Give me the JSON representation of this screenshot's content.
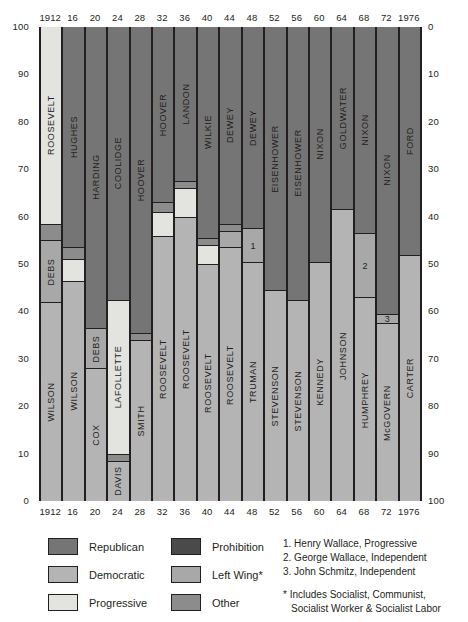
{
  "chart_data": {
    "type": "bar",
    "title": "",
    "subtitle": "",
    "xlabel": "",
    "ylabel": "",
    "ylim": [
      0,
      100
    ],
    "left_axis_ticks": [
      "100",
      "90",
      "80",
      "70",
      "60",
      "50",
      "40",
      "30",
      "20",
      "10",
      "0"
    ],
    "right_axis_ticks": [
      "0",
      "10",
      "20",
      "30",
      "40",
      "50",
      "60",
      "70",
      "80",
      "90",
      "100"
    ],
    "left_axis_direction": "descending",
    "right_axis_direction": "ascending",
    "grid": false,
    "legend_position": "bottom",
    "categories": [
      "1912",
      "16",
      "20",
      "24",
      "28",
      "32",
      "36",
      "40",
      "44",
      "48",
      "52",
      "56",
      "60",
      "64",
      "68",
      "72",
      "1976"
    ],
    "top_year_labels": [
      "1912",
      "16",
      "20",
      "24",
      "28",
      "32",
      "36",
      "40",
      "44",
      "48",
      "52",
      "56",
      "60",
      "64",
      "68",
      "72",
      "1976"
    ],
    "bottom_year_labels": [
      "1912",
      "16",
      "20",
      "24",
      "28",
      "32",
      "36",
      "40",
      "44",
      "48",
      "52",
      "56",
      "60",
      "64",
      "68",
      "72",
      "1976"
    ],
    "stack_order": "top-to-bottom",
    "columns": [
      {
        "year": "1912",
        "segments": [
          {
            "party": "Progressive",
            "label": "ROOSEVELT",
            "value": 41.5
          },
          {
            "party": "Other",
            "label": "",
            "value": 3.5
          },
          {
            "party": "Left Wing",
            "label": "DEBS",
            "value": 13.0
          },
          {
            "party": "Democratic",
            "label": "WILSON",
            "value": 42.0
          }
        ]
      },
      {
        "year": "16",
        "segments": [
          {
            "party": "Republican",
            "label": "HUGHES",
            "value": 46.5
          },
          {
            "party": "Other",
            "label": "",
            "value": 2.5
          },
          {
            "party": "Progressive",
            "label": "",
            "value": 4.5
          },
          {
            "party": "Democratic",
            "label": "WILSON",
            "value": 46.5
          }
        ]
      },
      {
        "year": "20",
        "segments": [
          {
            "party": "Republican",
            "label": "HARDING",
            "value": 63.5
          },
          {
            "party": "Left Wing",
            "label": "DEBS",
            "value": 8.5
          },
          {
            "party": "Democratic",
            "label": "COX",
            "value": 28.0
          }
        ]
      },
      {
        "year": "24",
        "segments": [
          {
            "party": "Republican",
            "label": "COOLIDGE",
            "value": 57.5
          },
          {
            "party": "Progressive",
            "label": "LAFOLLETTE",
            "value": 32.5
          },
          {
            "party": "Other",
            "label": "",
            "value": 1.5
          },
          {
            "party": "Democratic",
            "label": "DAVIS",
            "value": 8.5
          }
        ]
      },
      {
        "year": "28",
        "segments": [
          {
            "party": "Republican",
            "label": "HOOVER",
            "value": 64.5
          },
          {
            "party": "Other",
            "label": "",
            "value": 1.5
          },
          {
            "party": "Democratic",
            "label": "SMITH",
            "value": 34.0
          }
        ]
      },
      {
        "year": "32",
        "segments": [
          {
            "party": "Republican",
            "label": "HOOVER",
            "value": 37.0
          },
          {
            "party": "Other",
            "label": "",
            "value": 2.0
          },
          {
            "party": "Progressive",
            "label": "",
            "value": 5.0
          },
          {
            "party": "Democratic",
            "label": "ROOSEVELT",
            "value": 56.0
          }
        ]
      },
      {
        "year": "36",
        "segments": [
          {
            "party": "Republican",
            "label": "LANDON",
            "value": 32.5
          },
          {
            "party": "Other",
            "label": "",
            "value": 1.5
          },
          {
            "party": "Progressive",
            "label": "",
            "value": 6.0
          },
          {
            "party": "Democratic",
            "label": "ROOSEVELT",
            "value": 60.0
          }
        ]
      },
      {
        "year": "40",
        "segments": [
          {
            "party": "Republican",
            "label": "WILKIE",
            "value": 44.5
          },
          {
            "party": "Other",
            "label": "",
            "value": 1.5
          },
          {
            "party": "Progressive",
            "label": "",
            "value": 4.0
          },
          {
            "party": "Democratic",
            "label": "ROOSEVELT",
            "value": 50.0
          }
        ]
      },
      {
        "year": "44",
        "segments": [
          {
            "party": "Republican",
            "label": "DEWEY",
            "value": 41.5
          },
          {
            "party": "Other",
            "label": "",
            "value": 1.5
          },
          {
            "party": "Left Wing",
            "label": "",
            "value": 3.5
          },
          {
            "party": "Democratic",
            "label": "ROOSEVELT",
            "value": 53.5
          }
        ]
      },
      {
        "year": "48",
        "segments": [
          {
            "party": "Republican",
            "label": "DEWEY",
            "value": 42.5
          },
          {
            "party": "Left Wing",
            "label": "1",
            "value": 7.0
          },
          {
            "party": "Democratic",
            "label": "TRUMAN",
            "value": 50.5
          }
        ]
      },
      {
        "year": "52",
        "segments": [
          {
            "party": "Republican",
            "label": "EISENHOWER",
            "value": 55.5
          },
          {
            "party": "Democratic",
            "label": "STEVENSON",
            "value": 44.5
          }
        ]
      },
      {
        "year": "56",
        "segments": [
          {
            "party": "Republican",
            "label": "EISENHOWER",
            "value": 57.5
          },
          {
            "party": "Democratic",
            "label": "STEVENSON",
            "value": 42.5
          }
        ]
      },
      {
        "year": "60",
        "segments": [
          {
            "party": "Republican",
            "label": "NIXON",
            "value": 49.5
          },
          {
            "party": "Democratic",
            "label": "KENNEDY",
            "value": 50.5
          }
        ]
      },
      {
        "year": "64",
        "segments": [
          {
            "party": "Republican",
            "label": "GOLDWATER",
            "value": 38.5
          },
          {
            "party": "Democratic",
            "label": "JOHNSON",
            "value": 61.5
          }
        ]
      },
      {
        "year": "68",
        "segments": [
          {
            "party": "Republican",
            "label": "NIXON",
            "value": 43.5
          },
          {
            "party": "Left Wing",
            "label": "2",
            "value": 13.5
          },
          {
            "party": "Democratic",
            "label": "HUMPHREY",
            "value": 43.0
          }
        ]
      },
      {
        "year": "72",
        "segments": [
          {
            "party": "Republican",
            "label": "NIXON",
            "value": 60.5
          },
          {
            "party": "Left Wing",
            "label": "3",
            "value": 2.0
          },
          {
            "party": "Democratic",
            "label": "McGOVERN",
            "value": 37.5
          }
        ]
      },
      {
        "year": "1976",
        "segments": [
          {
            "party": "Republican",
            "label": "FORD",
            "value": 48.0
          },
          {
            "party": "Democratic",
            "label": "CARTER",
            "value": 52.0
          }
        ]
      }
    ],
    "legend": [
      {
        "label": "Republican",
        "color": "#757575"
      },
      {
        "label": "Democratic",
        "color": "#b4b4b4"
      },
      {
        "label": "Progressive",
        "color": "#e3e3e0"
      },
      {
        "label": "Prohibition",
        "color": "#4a4a4a"
      },
      {
        "label": "Left Wing*",
        "color": "#a8a8a8"
      },
      {
        "label": "Other",
        "color": "#8c8c8c"
      }
    ],
    "annotations": [
      "1. Henry Wallace, Progressive",
      "2. George Wallace, Independent",
      "3. John Schmitz, Independent"
    ],
    "footnote": [
      "* Includes Socialist, Communist,",
      "Socialist Worker & Socialist Labor"
    ]
  },
  "colors": {
    "Republican": "#757575",
    "Democratic": "#b4b4b4",
    "Progressive": "#e3e3e0",
    "Prohibition": "#4a4a4a",
    "Left Wing": "#a8a8a8",
    "Other": "#8c8c8c",
    "outline": "#231f20",
    "background": "#ffffff"
  }
}
